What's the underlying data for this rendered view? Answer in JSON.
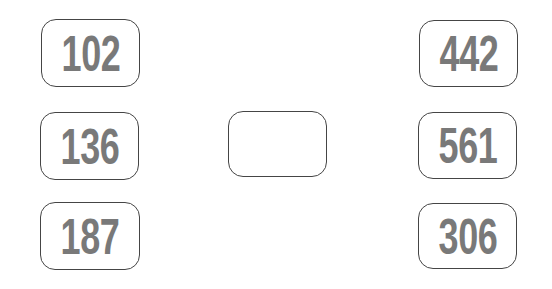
{
  "boxes": {
    "left_top": {
      "value": "102"
    },
    "left_middle": {
      "value": "136"
    },
    "left_bottom": {
      "value": "187"
    },
    "center": {
      "value": ""
    },
    "right_top": {
      "value": "442"
    },
    "right_middle": {
      "value": "561"
    },
    "right_bottom": {
      "value": "306"
    }
  },
  "colors": {
    "border": "#454545",
    "number_text": "#797979",
    "background": "#ffffff"
  }
}
